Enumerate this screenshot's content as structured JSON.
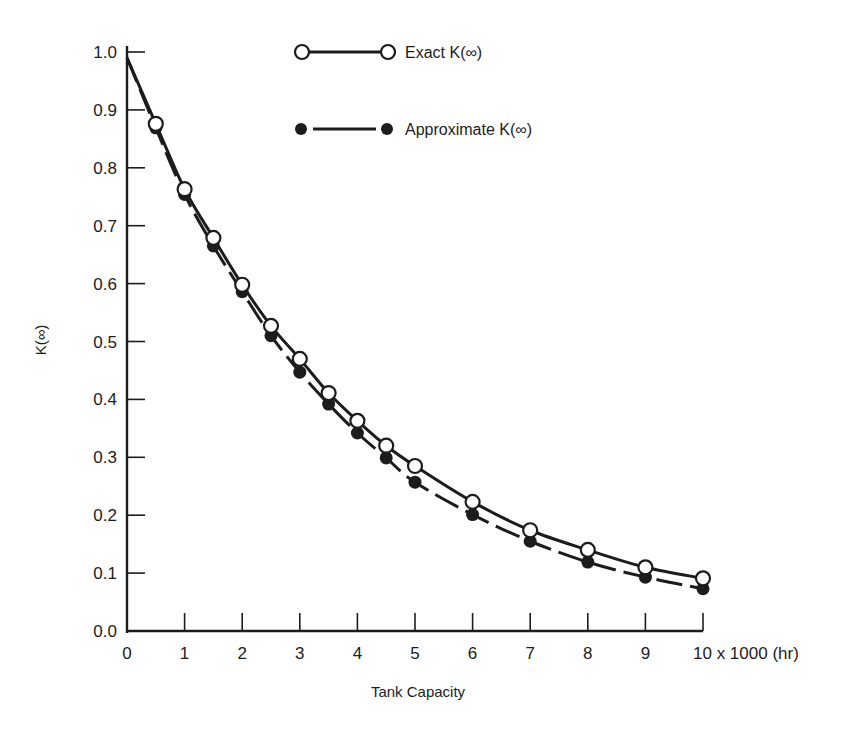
{
  "chart_data": {
    "type": "line",
    "title": "",
    "xlabel": "Tank Capacity",
    "xlabel_unit_suffix": "x 1000 (hr)",
    "ylabel": "K(∞)",
    "xlim": [
      0,
      10
    ],
    "ylim": [
      0.0,
      1.0
    ],
    "grid": false,
    "legend_position": "top-center-inside",
    "x_ticks": [
      0,
      1,
      2,
      3,
      4,
      5,
      6,
      7,
      8,
      9,
      10
    ],
    "x_tick_labels": [
      "0",
      "1",
      "2",
      "3",
      "4",
      "5",
      "6",
      "7",
      "8",
      "9",
      "10 x 1000 (hr)"
    ],
    "y_ticks": [
      0.0,
      0.1,
      0.2,
      0.3,
      0.4,
      0.5,
      0.6,
      0.7,
      0.8,
      0.9,
      1.0
    ],
    "y_tick_labels": [
      "0.0",
      "0.1",
      "0.2",
      "0.3",
      "0.4",
      "0.5",
      "0.6",
      "0.7",
      "0.8",
      "0.9",
      "1.0"
    ],
    "x": [
      0.5,
      1,
      1.5,
      2,
      2.5,
      3,
      3.5,
      4,
      4.5,
      5,
      6,
      7,
      8,
      9,
      10
    ],
    "curve_start": {
      "x": 0,
      "y": 0.99
    },
    "series": [
      {
        "name": "Exact K(∞)",
        "marker": "open-circle",
        "line_style": "solid",
        "values": [
          0.876,
          0.763,
          0.679,
          0.598,
          0.527,
          0.47,
          0.411,
          0.363,
          0.32,
          0.285,
          0.223,
          0.174,
          0.14,
          0.11,
          0.091
        ]
      },
      {
        "name": "Approximate K(∞)",
        "marker": "filled-circle",
        "line_style": "dashed",
        "values": [
          0.869,
          0.754,
          0.665,
          0.586,
          0.51,
          0.447,
          0.392,
          0.342,
          0.299,
          0.257,
          0.201,
          0.155,
          0.119,
          0.093,
          0.073
        ]
      }
    ]
  },
  "legend": {
    "items": [
      {
        "label": "Exact K(∞)",
        "marker": "open-circle"
      },
      {
        "label": "Approximate K(∞)",
        "marker": "filled-circle"
      }
    ]
  },
  "colors": {
    "ink": "#1c1c1c",
    "background": "#ffffff"
  }
}
